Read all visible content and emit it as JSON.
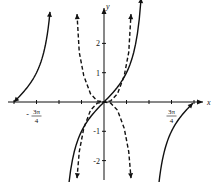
{
  "chart_data": {
    "type": "line",
    "title": "",
    "xlabel": "x",
    "ylabel": "y",
    "x_unit": "pi/4",
    "xlim": [
      -4.2,
      4.4
    ],
    "ylim": [
      -2.7,
      3.1
    ],
    "x_ticks": [
      -4,
      -3,
      -2,
      -1,
      1,
      2,
      3,
      4
    ],
    "x_tick_labels": [
      {
        "value": -3,
        "num": "3π",
        "den": "4",
        "sign": "-"
      },
      {
        "value": 3,
        "num": "3π",
        "den": "4",
        "sign": ""
      }
    ],
    "y_ticks": [
      -2,
      -1,
      1,
      2
    ],
    "y_tick_labels": [
      "-2",
      "-1",
      "1",
      "2"
    ],
    "grid": false,
    "series": [
      {
        "name": "y = tan x (solid)",
        "style": "solid",
        "function": "tan",
        "branches": [
          [
            -4.0,
            -2.4
          ],
          [
            -1.65,
            1.65
          ],
          [
            2.4,
            3.95
          ]
        ]
      },
      {
        "name": "dashed rising",
        "style": "dashed",
        "points": [
          [
            -1.2,
            -2.6
          ],
          [
            -1.1,
            -1.7
          ],
          [
            -0.9,
            -0.9
          ],
          [
            -0.6,
            -0.28
          ],
          [
            -0.3,
            -0.04
          ],
          [
            0,
            0
          ],
          [
            0.3,
            0.04
          ],
          [
            0.6,
            0.28
          ],
          [
            0.9,
            0.9
          ],
          [
            1.1,
            1.7
          ],
          [
            1.2,
            3.0
          ]
        ]
      },
      {
        "name": "dashed falling",
        "style": "dashed",
        "points": [
          [
            -1.2,
            3.0
          ],
          [
            -1.1,
            1.7
          ],
          [
            -0.9,
            0.9
          ],
          [
            -0.6,
            0.28
          ],
          [
            -0.3,
            0.04
          ],
          [
            0,
            0
          ],
          [
            0.3,
            -0.04
          ],
          [
            0.6,
            -0.28
          ],
          [
            0.9,
            -0.9
          ],
          [
            1.1,
            -1.7
          ],
          [
            1.2,
            -2.6
          ]
        ]
      }
    ]
  }
}
